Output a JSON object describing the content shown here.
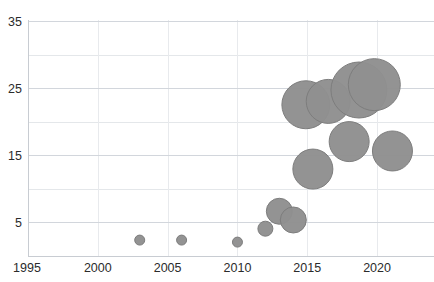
{
  "chart_data": {
    "type": "scatter",
    "title": "",
    "xlabel": "",
    "ylabel": "",
    "xlim": [
      1995,
      2022.5
    ],
    "ylim": [
      0,
      36
    ],
    "grid": true,
    "legend": "none",
    "x_ticks": [
      "1995",
      "2000",
      "2005",
      "2010",
      "2015",
      "2020"
    ],
    "x_tick_values": [
      1995,
      2000,
      2005,
      2010,
      2015,
      2020
    ],
    "y_ticks": [
      "5",
      "15",
      "25",
      "35"
    ],
    "y_tick_values": [
      5,
      15,
      25,
      35
    ],
    "y_minor_gridlines": [
      10,
      20,
      30
    ],
    "bubble_color": "#8f8f8f",
    "bubble_edge_color": "#7d7d7d",
    "grid_color": "#d2d6dc",
    "series": [
      {
        "name": "bubbles",
        "points": [
          {
            "x": 2003.0,
            "y": 2.3,
            "size": 5.0
          },
          {
            "x": 2006.0,
            "y": 2.3,
            "size": 5.0
          },
          {
            "x": 2010.0,
            "y": 2.0,
            "size": 5.0
          },
          {
            "x": 2012.0,
            "y": 4.0,
            "size": 7.5
          },
          {
            "x": 2013.0,
            "y": 6.6,
            "size": 13.0
          },
          {
            "x": 2014.0,
            "y": 5.3,
            "size": 13.0
          },
          {
            "x": 2015.4,
            "y": 12.9,
            "size": 20.0
          },
          {
            "x": 2014.9,
            "y": 22.5,
            "size": 24.0
          },
          {
            "x": 2016.5,
            "y": 23.0,
            "size": 22.0
          },
          {
            "x": 2018.0,
            "y": 17.0,
            "size": 20.0
          },
          {
            "x": 2018.7,
            "y": 24.7,
            "size": 28.0
          },
          {
            "x": 2019.8,
            "y": 25.5,
            "size": 26.0
          },
          {
            "x": 2021.1,
            "y": 15.6,
            "size": 20.0
          }
        ]
      }
    ]
  },
  "axis_labels": {
    "y": [
      {
        "text": "35",
        "value": 35
      },
      {
        "text": "25",
        "value": 25
      },
      {
        "text": "15",
        "value": 15
      },
      {
        "text": "5",
        "value": 5
      }
    ],
    "x": [
      {
        "text": "1995",
        "value": 1995
      },
      {
        "text": "2000",
        "value": 2000
      },
      {
        "text": "2005",
        "value": 2005
      },
      {
        "text": "2010",
        "value": 2010
      },
      {
        "text": "2015",
        "value": 2015
      },
      {
        "text": "2020",
        "value": 2020
      }
    ]
  }
}
